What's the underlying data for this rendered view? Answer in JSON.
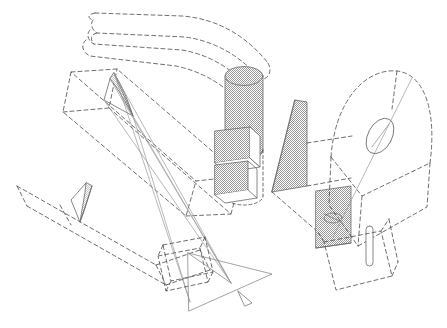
{
  "figure": {
    "type": "technical-line-diagram",
    "canvas": {
      "width": 447,
      "height": 328,
      "background": "#ffffff"
    },
    "stroke_colors": {
      "dashed_construction": "#4a4a4a",
      "solid_ray": "#8c8c8c",
      "outline": "#5a5a5a",
      "stipple_fill": "#9a9a9a",
      "stipple_background": "#ffffff"
    },
    "line_styles": {
      "dash_pattern": "4 3",
      "fine_dash_pattern": "3 2.5",
      "stroke_width": 0.8
    }
  },
  "components": [
    {
      "id": "upper-curved-band",
      "name": "Upper curved dashed band",
      "style": "dashed",
      "description": "Three nested curved bands sweeping from upper-left down to the right toward the cylinder"
    },
    {
      "id": "upper-left-box",
      "name": "Upper-left dashed parallelepiped",
      "style": "dashed",
      "description": "Long slender box angled down-right"
    },
    {
      "id": "top-lens",
      "name": "Narrow lens element near top",
      "style": "solid-outline",
      "description": "Thin pointed-oval mirror with converging solid rays"
    },
    {
      "id": "cylinder",
      "name": "Stippled vertical cylinder",
      "style": "stippled",
      "description": "Cylindrical barrel with elliptical top cap, halftone shaded"
    },
    {
      "id": "stacked-panels",
      "name": "Stacked stippled panels",
      "style": "stippled",
      "description": "Two shaded rectangular plates below the cylinder"
    },
    {
      "id": "mid-blade-panel",
      "name": "Stippled blade panel",
      "style": "stippled",
      "description": "Tall parallelogram plate right of center"
    },
    {
      "id": "dome",
      "name": "Dashed dome / arch housing",
      "style": "dashed",
      "description": "Arch-topped housing at right containing the lens on its optical axis"
    },
    {
      "id": "dome-lens",
      "name": "Lens ellipse on optical axis",
      "style": "solid-outline",
      "description": "Small ellipse crossed by the diagonal axis line"
    },
    {
      "id": "lower-right-rhombus",
      "name": "Stippled rhombus plate",
      "style": "stippled",
      "description": "Shaded rhombus panel at lower right with small vertical pin beside it"
    },
    {
      "id": "pin-cylinder",
      "name": "Small vertical pin cylinder",
      "style": "solid-outline",
      "description": "Narrow rounded-end cylinder right of the rhombus"
    },
    {
      "id": "lower-right-box",
      "name": "Lower-right dashed box",
      "style": "dashed",
      "description": "Tilted dashed quadrilateral frame"
    },
    {
      "id": "lower-left-beam",
      "name": "Lower-left dashed beam",
      "style": "dashed",
      "description": "Long dashed ray corridor with small stippled lens"
    },
    {
      "id": "lower-left-lens",
      "name": "Small stippled lens",
      "style": "stippled",
      "description": "Pointed-oval shaded lens inside the lower-left beam"
    },
    {
      "id": "center-dashed-frame",
      "name": "Center dashed frame",
      "style": "dashed",
      "description": "Small tilted rectangular frame at bottom center"
    },
    {
      "id": "ray-triangle",
      "name": "Solid ray triangle",
      "style": "solid",
      "description": "Triangle of converging solid rays at bottom center"
    },
    {
      "id": "ray-arrowhead",
      "name": "Ray direction arrowhead",
      "style": "solid-outline",
      "description": "Open arrowhead pointing down-right at the end of the principal ray"
    }
  ]
}
